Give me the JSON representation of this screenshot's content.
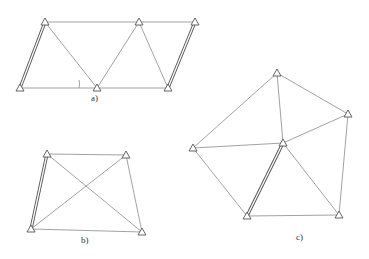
{
  "figures": [
    {
      "id": "a",
      "label": "a)",
      "label_pos": [
        91,
        101
      ],
      "stations": [
        [
          45,
          22
        ],
        [
          139,
          22
        ],
        [
          195,
          22
        ],
        [
          20,
          88
        ],
        [
          97,
          88
        ],
        [
          168,
          88
        ]
      ],
      "edges": [
        [
          0,
          1
        ],
        [
          1,
          2
        ],
        [
          3,
          4
        ],
        [
          4,
          5
        ],
        [
          0,
          4
        ],
        [
          1,
          4
        ],
        [
          1,
          5
        ]
      ],
      "baselines": [
        [
          0,
          3
        ],
        [
          2,
          5
        ]
      ],
      "angle_mark": {
        "x": 79,
        "y1": 80,
        "y2": 88
      }
    },
    {
      "id": "b",
      "label": "b)",
      "label_pos": [
        81,
        243
      ],
      "stations": [
        [
          47,
          154
        ],
        [
          126,
          155
        ],
        [
          31,
          229
        ],
        [
          142,
          232
        ]
      ],
      "edges": [
        [
          0,
          1
        ],
        [
          2,
          3
        ],
        [
          1,
          3
        ],
        [
          0,
          3
        ],
        [
          1,
          2
        ]
      ],
      "baselines": [
        [
          0,
          2
        ]
      ]
    },
    {
      "id": "c",
      "label": "c)",
      "label_pos": [
        296,
        240
      ],
      "stations": [
        [
          277,
          73
        ],
        [
          348,
          114
        ],
        [
          193,
          148
        ],
        [
          283,
          143
        ],
        [
          247,
          216
        ],
        [
          339,
          215
        ]
      ],
      "edges": [
        [
          0,
          2
        ],
        [
          0,
          1
        ],
        [
          0,
          3
        ],
        [
          2,
          3
        ],
        [
          3,
          1
        ],
        [
          1,
          5
        ],
        [
          2,
          4
        ],
        [
          4,
          5
        ],
        [
          3,
          5
        ]
      ],
      "baselines": [
        [
          3,
          4
        ]
      ]
    }
  ],
  "colors": {
    "line": "#8a8a8a",
    "baseline": "#555555",
    "background": "#ffffff"
  }
}
